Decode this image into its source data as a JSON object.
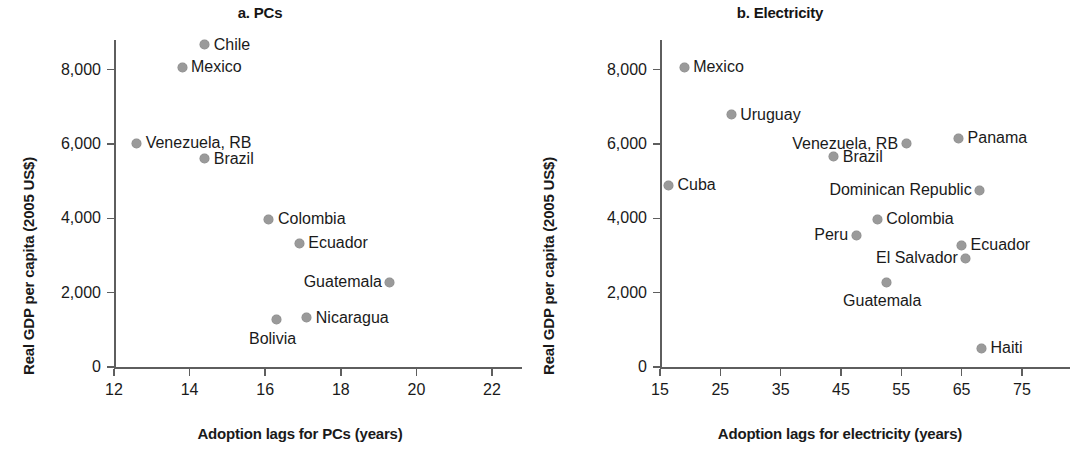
{
  "figure": {
    "background": "#ffffff",
    "marker_color": "#9a9a9a",
    "axis_color": "#5e5e5e",
    "text_color": "#1a1a1a"
  },
  "panels": {
    "a": {
      "title": "a. PCs",
      "xlabel": "Adoption lags for PCs (years)",
      "ylabel": "Real GDP per capita (2005 US$)",
      "xticks": [
        "12",
        "14",
        "16",
        "18",
        "20",
        "22"
      ],
      "yticks": [
        "8,000",
        "6,000",
        "4,000",
        "2,000",
        "0"
      ]
    },
    "b": {
      "title": "b. Electricity",
      "xlabel": "Adoption lags for electricity (years)",
      "ylabel": "Real GDP per capita (2005 US$)",
      "xticks": [
        "15",
        "25",
        "35",
        "45",
        "55",
        "65",
        "75"
      ],
      "yticks": [
        "8,000",
        "6,000",
        "4,000",
        "2,000",
        "0"
      ]
    }
  },
  "chart_data": [
    {
      "type": "scatter",
      "panel": "a",
      "title": "a. PCs",
      "xlabel": "Adoption lags for PCs (years)",
      "ylabel": "Real GDP per capita (2005 US$)",
      "xlim": [
        12,
        22
      ],
      "ylim": [
        0,
        8800
      ],
      "xticks": [
        12,
        14,
        16,
        18,
        20,
        22
      ],
      "yticks": [
        0,
        2000,
        4000,
        6000,
        8000
      ],
      "grid": false,
      "legend": null,
      "points": [
        {
          "label": "Chile",
          "x": 14.4,
          "y": 8670,
          "label_side": "right"
        },
        {
          "label": "Mexico",
          "x": 13.8,
          "y": 8060,
          "label_side": "right"
        },
        {
          "label": "Venezuela, RB",
          "x": 12.6,
          "y": 6020,
          "label_side": "right"
        },
        {
          "label": "Brazil",
          "x": 14.4,
          "y": 5600,
          "label_side": "right"
        },
        {
          "label": "Colombia",
          "x": 16.1,
          "y": 3980,
          "label_side": "right"
        },
        {
          "label": "Ecuador",
          "x": 16.9,
          "y": 3330,
          "label_side": "right"
        },
        {
          "label": "Guatemala",
          "x": 19.3,
          "y": 2280,
          "label_side": "left"
        },
        {
          "label": "Nicaragua",
          "x": 17.1,
          "y": 1330,
          "label_side": "right"
        },
        {
          "label": "Bolivia",
          "x": 16.3,
          "y": 1270,
          "label_side": "below"
        }
      ]
    },
    {
      "type": "scatter",
      "panel": "b",
      "title": "b. Electricity",
      "xlabel": "Adoption lags for electricity (years)",
      "ylabel": "Real GDP per capita (2005 US$)",
      "xlim": [
        15,
        78
      ],
      "ylim": [
        0,
        8800
      ],
      "xticks": [
        15,
        25,
        35,
        45,
        55,
        65,
        75
      ],
      "yticks": [
        0,
        2000,
        4000,
        6000,
        8000
      ],
      "grid": false,
      "legend": null,
      "points": [
        {
          "label": "Mexico",
          "x": 19.0,
          "y": 8060,
          "label_side": "right"
        },
        {
          "label": "Uruguay",
          "x": 26.8,
          "y": 6790,
          "label_side": "right"
        },
        {
          "label": "Panama",
          "x": 64.5,
          "y": 6150,
          "label_side": "right"
        },
        {
          "label": "Venezuela, RB",
          "x": 55.8,
          "y": 6010,
          "label_side": "left"
        },
        {
          "label": "Brazil",
          "x": 43.8,
          "y": 5660,
          "label_side": "right"
        },
        {
          "label": "Cuba",
          "x": 16.4,
          "y": 4890,
          "label_side": "right"
        },
        {
          "label": "Dominican Republic",
          "x": 68.0,
          "y": 4750,
          "label_side": "left"
        },
        {
          "label": "Colombia",
          "x": 51.0,
          "y": 3970,
          "label_side": "right"
        },
        {
          "label": "Peru",
          "x": 47.5,
          "y": 3540,
          "label_side": "left"
        },
        {
          "label": "Ecuador",
          "x": 65.0,
          "y": 3280,
          "label_side": "right"
        },
        {
          "label": "El Salvador",
          "x": 65.7,
          "y": 2930,
          "label_side": "left"
        },
        {
          "label": "Guatemala",
          "x": 52.5,
          "y": 2280,
          "label_side": "below"
        },
        {
          "label": "Haiti",
          "x": 68.3,
          "y": 500,
          "label_side": "right"
        }
      ]
    }
  ]
}
